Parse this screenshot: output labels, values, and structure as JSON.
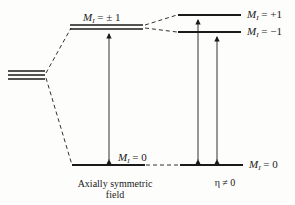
{
  "diagram": {
    "type": "energy-level-splitting",
    "symbol": "M",
    "subscript": "I",
    "left_panel": {
      "caption_line1": "Axially symmetric",
      "caption_line2": "field",
      "levels": [
        {
          "id": "pm1",
          "label": "= ± 1"
        },
        {
          "id": "zero",
          "label": "= 0"
        }
      ]
    },
    "right_panel": {
      "caption": "η ≠ 0",
      "levels": [
        {
          "id": "plus1",
          "label": "= +1"
        },
        {
          "id": "minus1",
          "label": "= −1"
        },
        {
          "id": "zero",
          "label": "= 0"
        }
      ]
    },
    "transitions": [
      {
        "panel": "left",
        "from": "0",
        "to": "±1",
        "bidirectional": true
      },
      {
        "panel": "right",
        "from": "0",
        "to": "+1",
        "bidirectional": true
      },
      {
        "panel": "right",
        "from": "0",
        "to": "−1",
        "bidirectional": true
      }
    ],
    "colors": {
      "line": "#1a1a1a",
      "background": "#fdfdfc"
    }
  }
}
